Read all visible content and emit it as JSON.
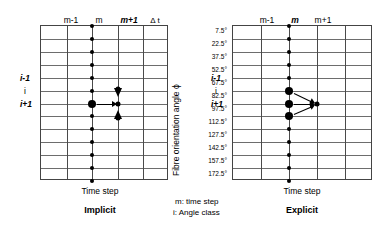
{
  "figure": {
    "axis_y_label": "Fibre orientation angle ϕ",
    "angle_ticks": [
      "7.5°",
      "22.5°",
      "37.5°",
      "52.5°",
      "67.5°",
      "82.5°",
      "97.5°",
      "112.5°",
      "127.5°",
      "142.5°",
      "157.5°",
      "172.5°"
    ],
    "legend": {
      "line1": "m: time step",
      "line2": "i: Angle class"
    }
  },
  "implicit": {
    "caption": "Implicit",
    "x_axis_title": "Time step",
    "col_labels": [
      "m-1",
      "m",
      "m+1"
    ],
    "delta_label": "Δ t",
    "row_labels": [
      "i-1",
      "i",
      "i+1"
    ]
  },
  "explicit": {
    "caption": "Explicit",
    "x_axis_title": "Time step",
    "col_labels": [
      "m-1",
      "m",
      "m+1"
    ],
    "row_labels": [
      "i-1",
      "i",
      "i+1"
    ]
  },
  "chart_data": {
    "type": "diagram-grid",
    "xlabel": "Time step",
    "ylabel": "Fibre orientation angle ϕ",
    "y_categories": [
      "7.5°",
      "22.5°",
      "37.5°",
      "52.5°",
      "67.5°",
      "82.5°",
      "97.5°",
      "112.5°",
      "127.5°",
      "142.5°",
      "157.5°",
      "172.5°"
    ],
    "x_categories": [
      "m-1",
      "m",
      "m+1"
    ],
    "grid": {
      "rows": 12,
      "cols": 5,
      "grid_on": true
    },
    "panels": [
      {
        "name": "Implicit",
        "nodes_column_m": [
          "all rows 1-12 small dots",
          "large dot at row i (82.5°)"
        ],
        "nodes_column_m_plus_1": [
          "arrow-marker at row i-1 (67.5°)",
          "small dot at row i (82.5°)",
          "arrow-marker at row i+1 (97.5°)"
        ],
        "arrows": [
          {
            "from": "m,i",
            "to": "m+1,i",
            "direction": "horizontal"
          },
          {
            "from": "m+1,i-1",
            "to": "m+1,i",
            "direction": "vertical-down"
          },
          {
            "from": "m+1,i+1",
            "to": "m+1,i",
            "direction": "vertical-up"
          }
        ]
      },
      {
        "name": "Explicit",
        "nodes_column_m": [
          "all rows 1-12 small dots",
          "large dots at rows i-1, i, i+1 (67.5°, 82.5°, 97.5°)"
        ],
        "nodes_column_m_plus_1": [
          "small dot at row i (82.5°)"
        ],
        "arrows": [
          {
            "from": "m,i-1",
            "to": "m+1,i",
            "direction": "diagonal-down"
          },
          {
            "from": "m,i",
            "to": "m+1,i",
            "direction": "horizontal"
          },
          {
            "from": "m,i+1",
            "to": "m+1,i",
            "direction": "diagonal-up"
          }
        ]
      }
    ]
  }
}
